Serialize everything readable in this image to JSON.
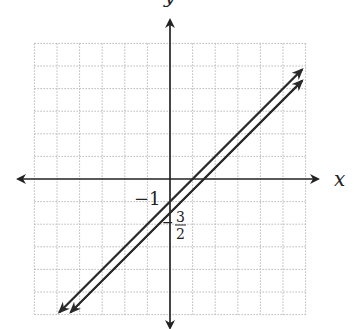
{
  "diagram": {
    "type": "coordinate-plane",
    "axes": {
      "x_label": "x",
      "y_label": "y"
    },
    "grid": {
      "x_range": [
        -6,
        6
      ],
      "y_range": [
        -6,
        6
      ],
      "step": 1,
      "style": "dotted"
    },
    "lines": [
      {
        "name": "line-1",
        "slope": 1,
        "y_intercept": -1,
        "equation": "y = x - 1"
      },
      {
        "name": "line-2",
        "slope": 1,
        "y_intercept": -1.5,
        "equation": "y = x - 3/2"
      }
    ],
    "annotations": {
      "intercept_1": "−1",
      "intercept_2_num": "3",
      "intercept_2_den": "2",
      "intercept_2_sign": "−"
    },
    "colors": {
      "axis": "#222222",
      "grid": "#b8b8b8",
      "line": "#2a2a2a"
    }
  }
}
